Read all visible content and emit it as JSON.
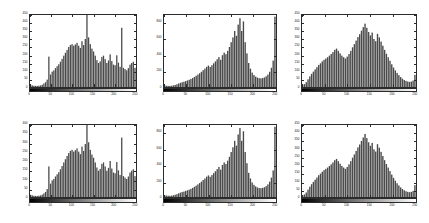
{
  "figure": {
    "title": "",
    "background_color": "#ffffff",
    "axis_color": "#2b2b2b",
    "bar_color": "#4a4a4a",
    "rows": 2,
    "columns": 3,
    "panel_count": 6
  },
  "colorbar": {
    "name": "grayscale-colorbar",
    "from": "#000000",
    "to": "#ffffff",
    "orientation": "horizontal"
  },
  "chart_data": [
    {
      "type": "bar",
      "title": "",
      "xlabel": "",
      "ylabel": "",
      "grid": false,
      "legend": null,
      "xlim": [
        0,
        255
      ],
      "ylim": [
        0,
        450
      ],
      "xticks": [
        0,
        50,
        100,
        150,
        200,
        250
      ],
      "xticklabels": [
        "0",
        "50",
        "100",
        "150",
        "200",
        "250"
      ],
      "yticks": [
        0,
        50,
        100,
        150,
        200,
        250,
        300,
        350,
        400,
        450
      ],
      "yticklabels": [
        "0",
        "50",
        "100",
        "150",
        "200",
        "250",
        "300",
        "350",
        "400",
        "450"
      ],
      "x": [
        0,
        4,
        8,
        12,
        16,
        20,
        24,
        28,
        32,
        36,
        40,
        44,
        48,
        52,
        56,
        60,
        64,
        68,
        72,
        76,
        80,
        84,
        88,
        92,
        96,
        100,
        104,
        108,
        112,
        116,
        120,
        124,
        128,
        132,
        136,
        140,
        144,
        148,
        152,
        156,
        160,
        164,
        168,
        172,
        176,
        180,
        184,
        188,
        192,
        196,
        200,
        204,
        208,
        212,
        216,
        220,
        224,
        228,
        232,
        236,
        240,
        244,
        248,
        252
      ],
      "values": [
        14,
        10,
        8,
        7,
        7,
        8,
        10,
        14,
        22,
        30,
        46,
        190,
        78,
        96,
        104,
        118,
        130,
        142,
        158,
        176,
        196,
        214,
        232,
        250,
        262,
        268,
        258,
        266,
        276,
        258,
        244,
        286,
        262,
        300,
        450,
        310,
        268,
        240,
        222,
        196,
        168,
        150,
        160,
        188,
        196,
        174,
        150,
        166,
        204,
        162,
        140,
        136,
        198,
        152,
        126,
        370,
        120,
        112,
        104,
        118,
        140,
        150,
        158,
        120
      ]
    },
    {
      "type": "bar",
      "title": "",
      "xlabel": "",
      "ylabel": "",
      "grid": false,
      "legend": null,
      "xlim": [
        0,
        255
      ],
      "ylim": [
        0,
        900
      ],
      "xticks": [
        0,
        50,
        100,
        150,
        200,
        250
      ],
      "xticklabels": [
        "0",
        "50",
        "100",
        "150",
        "200",
        "250"
      ],
      "yticks": [
        0,
        200,
        400,
        600,
        800
      ],
      "yticklabels": [
        "0",
        "200",
        "400",
        "600",
        "800"
      ],
      "x": [
        0,
        4,
        8,
        12,
        16,
        20,
        24,
        28,
        32,
        36,
        40,
        44,
        48,
        52,
        56,
        60,
        64,
        68,
        72,
        76,
        80,
        84,
        88,
        92,
        96,
        100,
        104,
        108,
        112,
        116,
        120,
        124,
        128,
        132,
        136,
        140,
        144,
        148,
        152,
        156,
        160,
        164,
        168,
        172,
        176,
        180,
        184,
        188,
        192,
        196,
        200,
        204,
        208,
        212,
        216,
        220,
        224,
        228,
        232,
        236,
        240,
        244,
        248,
        252
      ],
      "values": [
        20,
        16,
        14,
        14,
        16,
        20,
        26,
        34,
        44,
        52,
        60,
        66,
        74,
        82,
        90,
        100,
        112,
        126,
        140,
        156,
        172,
        190,
        210,
        230,
        252,
        268,
        250,
        272,
        296,
        320,
        346,
        374,
        340,
        398,
        430,
        410,
        452,
        500,
        560,
        620,
        700,
        640,
        780,
        860,
        700,
        820,
        560,
        420,
        300,
        230,
        180,
        150,
        130,
        118,
        110,
        108,
        112,
        120,
        134,
        156,
        190,
        240,
        330,
        880
      ]
    },
    {
      "type": "bar",
      "title": "",
      "xlabel": "",
      "ylabel": "",
      "grid": false,
      "legend": null,
      "xlim": [
        0,
        255
      ],
      "ylim": [
        0,
        450
      ],
      "xticks": [
        0,
        50,
        100,
        150,
        200,
        250
      ],
      "xticklabels": [
        "0",
        "50",
        "100",
        "150",
        "200",
        "250"
      ],
      "yticks": [
        0,
        50,
        100,
        150,
        200,
        250,
        300,
        350,
        400,
        450
      ],
      "yticklabels": [
        "0",
        "50",
        "100",
        "150",
        "200",
        "250",
        "300",
        "350",
        "400",
        "450"
      ],
      "x": [
        0,
        4,
        8,
        12,
        16,
        20,
        24,
        28,
        32,
        36,
        40,
        44,
        48,
        52,
        56,
        60,
        64,
        68,
        72,
        76,
        80,
        84,
        88,
        92,
        96,
        100,
        104,
        108,
        112,
        116,
        120,
        124,
        128,
        132,
        136,
        140,
        144,
        148,
        152,
        156,
        160,
        164,
        168,
        172,
        176,
        180,
        184,
        188,
        192,
        196,
        200,
        204,
        208,
        212,
        216,
        220,
        224,
        228,
        232,
        236,
        240,
        244,
        248,
        252
      ],
      "values": [
        12,
        18,
        30,
        48,
        66,
        82,
        96,
        110,
        124,
        138,
        148,
        160,
        170,
        178,
        186,
        196,
        206,
        218,
        232,
        240,
        226,
        210,
        196,
        186,
        178,
        190,
        206,
        226,
        248,
        268,
        290,
        312,
        330,
        352,
        374,
        396,
        370,
        344,
        322,
        340,
        300,
        286,
        332,
        310,
        284,
        258,
        232,
        208,
        186,
        164,
        142,
        122,
        104,
        88,
        74,
        62,
        52,
        44,
        38,
        34,
        32,
        34,
        40,
        76
      ]
    },
    {
      "type": "bar",
      "title": "",
      "xlabel": "",
      "ylabel": "",
      "grid": false,
      "legend": null,
      "xlim": [
        0,
        255
      ],
      "ylim": [
        0,
        400
      ],
      "xticks": [
        0,
        50,
        100,
        150,
        200,
        250
      ],
      "xticklabels": [
        "0",
        "50",
        "100",
        "150",
        "200",
        "250"
      ],
      "yticks": [
        0,
        50,
        100,
        150,
        200,
        250,
        300,
        350,
        400
      ],
      "yticklabels": [
        "0",
        "50",
        "100",
        "150",
        "200",
        "250",
        "300",
        "350",
        "400"
      ],
      "x": [
        0,
        4,
        8,
        12,
        16,
        20,
        24,
        28,
        32,
        36,
        40,
        44,
        48,
        52,
        56,
        60,
        64,
        68,
        72,
        76,
        80,
        84,
        88,
        92,
        96,
        100,
        104,
        108,
        112,
        116,
        120,
        124,
        128,
        132,
        136,
        140,
        144,
        148,
        152,
        156,
        160,
        164,
        168,
        172,
        176,
        180,
        184,
        188,
        192,
        196,
        200,
        204,
        208,
        212,
        216,
        220,
        224,
        228,
        232,
        236,
        240,
        244,
        248,
        252
      ],
      "values": [
        12,
        9,
        7,
        6,
        6,
        7,
        9,
        13,
        20,
        28,
        44,
        170,
        74,
        92,
        100,
        114,
        126,
        138,
        154,
        172,
        192,
        210,
        228,
        244,
        256,
        262,
        252,
        260,
        270,
        252,
        238,
        280,
        256,
        294,
        400,
        304,
        262,
        236,
        218,
        192,
        164,
        146,
        156,
        184,
        192,
        170,
        146,
        162,
        200,
        158,
        136,
        132,
        194,
        148,
        122,
        330,
        116,
        108,
        100,
        114,
        136,
        146,
        154,
        116
      ]
    },
    {
      "type": "bar",
      "title": "",
      "xlabel": "",
      "ylabel": "",
      "grid": false,
      "legend": null,
      "xlim": [
        0,
        255
      ],
      "ylim": [
        0,
        900
      ],
      "xticks": [
        0,
        50,
        100,
        150,
        200,
        250
      ],
      "xticklabels": [
        "0",
        "50",
        "100",
        "150",
        "200",
        "250"
      ],
      "yticks": [
        0,
        200,
        400,
        600,
        800
      ],
      "yticklabels": [
        "0",
        "200",
        "400",
        "600",
        "800"
      ],
      "x": [
        0,
        4,
        8,
        12,
        16,
        20,
        24,
        28,
        32,
        36,
        40,
        44,
        48,
        52,
        56,
        60,
        64,
        68,
        72,
        76,
        80,
        84,
        88,
        92,
        96,
        100,
        104,
        108,
        112,
        116,
        120,
        124,
        128,
        132,
        136,
        140,
        144,
        148,
        152,
        156,
        160,
        164,
        168,
        172,
        176,
        180,
        184,
        188,
        192,
        196,
        200,
        204,
        208,
        212,
        216,
        220,
        224,
        228,
        232,
        236,
        240,
        244,
        248,
        252
      ],
      "values": [
        22,
        18,
        16,
        15,
        17,
        22,
        28,
        36,
        46,
        54,
        62,
        68,
        76,
        84,
        92,
        102,
        114,
        128,
        142,
        158,
        174,
        192,
        212,
        232,
        254,
        270,
        252,
        274,
        298,
        322,
        348,
        376,
        342,
        400,
        432,
        412,
        454,
        502,
        562,
        622,
        702,
        642,
        782,
        862,
        702,
        822,
        562,
        422,
        302,
        232,
        182,
        152,
        132,
        120,
        112,
        110,
        114,
        122,
        136,
        158,
        192,
        242,
        332,
        878
      ]
    },
    {
      "type": "bar",
      "title": "",
      "xlabel": "",
      "ylabel": "",
      "grid": false,
      "legend": null,
      "xlim": [
        0,
        255
      ],
      "ylim": [
        0,
        450
      ],
      "xticks": [
        0,
        50,
        100,
        150,
        200,
        250
      ],
      "xticklabels": [
        "0",
        "50",
        "100",
        "150",
        "200",
        "250"
      ],
      "yticks": [
        0,
        50,
        100,
        150,
        200,
        250,
        300,
        350,
        400,
        450
      ],
      "yticklabels": [
        "0",
        "50",
        "100",
        "150",
        "200",
        "250",
        "300",
        "350",
        "400",
        "450"
      ],
      "x": [
        0,
        4,
        8,
        12,
        16,
        20,
        24,
        28,
        32,
        36,
        40,
        44,
        48,
        52,
        56,
        60,
        64,
        68,
        72,
        76,
        80,
        84,
        88,
        92,
        96,
        100,
        104,
        108,
        112,
        116,
        120,
        124,
        128,
        132,
        136,
        140,
        144,
        148,
        152,
        156,
        160,
        164,
        168,
        172,
        176,
        180,
        184,
        188,
        192,
        196,
        200,
        204,
        208,
        212,
        216,
        220,
        224,
        228,
        232,
        236,
        240,
        244,
        248,
        252
      ],
      "values": [
        10,
        16,
        28,
        46,
        64,
        80,
        94,
        108,
        122,
        136,
        146,
        158,
        168,
        176,
        184,
        194,
        204,
        216,
        230,
        238,
        224,
        208,
        194,
        184,
        176,
        188,
        204,
        224,
        246,
        266,
        288,
        310,
        328,
        350,
        372,
        394,
        368,
        342,
        320,
        338,
        298,
        284,
        330,
        308,
        282,
        256,
        230,
        206,
        184,
        162,
        140,
        120,
        102,
        86,
        72,
        60,
        50,
        42,
        36,
        32,
        30,
        32,
        38,
        74
      ]
    }
  ],
  "panels": [
    {
      "name": "histogram-panel-top-left",
      "row": 0,
      "col": 0
    },
    {
      "name": "histogram-panel-top-center",
      "row": 0,
      "col": 1
    },
    {
      "name": "histogram-panel-top-right",
      "row": 0,
      "col": 2
    },
    {
      "name": "histogram-panel-bottom-left",
      "row": 1,
      "col": 0
    },
    {
      "name": "histogram-panel-bottom-center",
      "row": 1,
      "col": 1
    },
    {
      "name": "histogram-panel-bottom-right",
      "row": 1,
      "col": 2
    }
  ]
}
